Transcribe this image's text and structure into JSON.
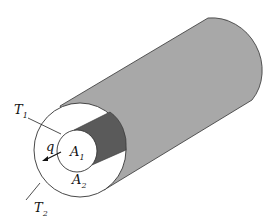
{
  "diagram": {
    "type": "hollow cylinder cross-section (heat conduction)",
    "colors": {
      "shell": "#a8a8a8",
      "inner_surface": "#5a5a5a",
      "faces": "#ffffff",
      "outline": "#333333"
    },
    "labels": {
      "t1": {
        "main": "T",
        "sub": "1"
      },
      "t2": {
        "main": "T",
        "sub": "2"
      },
      "a1": {
        "main": "A",
        "sub": "1"
      },
      "a2": {
        "main": "A",
        "sub": "2"
      },
      "q": "q"
    }
  }
}
